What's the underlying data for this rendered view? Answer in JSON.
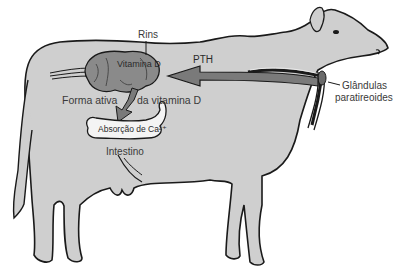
{
  "diagram": {
    "labels": {
      "kidneys": "Rins",
      "vitamin_d": "Vitamina D",
      "pth": "PTH",
      "active_form_left": "Forma ativa",
      "active_form_right": "da vitamina D",
      "calcium_absorption": "Absorção de Ca²⁺",
      "intestine": "Intestino",
      "parathyroid_line1": "Glândulas",
      "parathyroid_line2": "paratireoides"
    },
    "arrows": [
      {
        "from": "parathyroid",
        "to": "kidneys",
        "label": "PTH"
      },
      {
        "from": "kidneys",
        "to": "intestine",
        "label": "Forma ativa da vitamina D"
      }
    ],
    "colors": {
      "body_fill": "#cfcfcf",
      "outline": "#1a1a1a",
      "arrow_fill": "#7a7a7a",
      "organ_fill": "#8a8a8a",
      "intestine_fill": "#f4f4f4",
      "text": "#3a3a3a"
    }
  }
}
